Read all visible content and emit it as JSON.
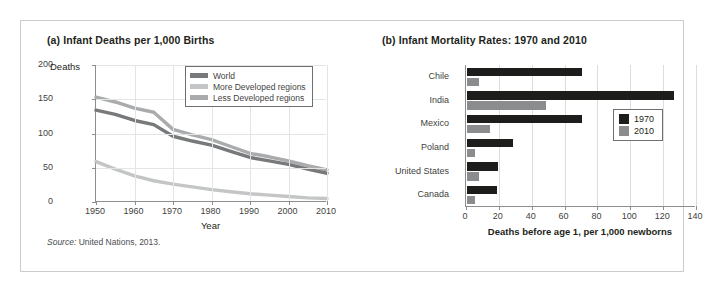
{
  "figure": {
    "source_prefix": "Source:",
    "source_text": " United Nations, 2013."
  },
  "panel_a": {
    "title": "(a) Infant Deaths per 1,000 Births",
    "ylabel": "Deaths",
    "xlabel": "Year",
    "legend": [
      {
        "label": "World",
        "color": "#77797b"
      },
      {
        "label": "More Developed regions",
        "color": "#c3c5c7"
      },
      {
        "label": "Less Developed regions",
        "color": "#a9abad"
      }
    ]
  },
  "panel_b": {
    "title": "(b) Infant Mortality Rates: 1970 and 2010",
    "xlabel": "Deaths before age 1, per 1,000 newborns",
    "legend": [
      {
        "label": "1970",
        "color": "#1d1d1b"
      },
      {
        "label": "2010",
        "color": "#8a8c8e"
      }
    ]
  },
  "chart_data": [
    {
      "type": "line",
      "title": "(a) Infant Deaths per 1,000 Births",
      "xlabel": "Year",
      "ylabel": "Deaths",
      "xlim": [
        1950,
        2010
      ],
      "ylim": [
        0,
        200
      ],
      "xticks": [
        1950,
        1960,
        1970,
        1980,
        1990,
        2000,
        2010
      ],
      "yticks": [
        0,
        50,
        100,
        150,
        200
      ],
      "grid": true,
      "legend_position": "top-right",
      "x": [
        1950,
        1955,
        1960,
        1965,
        1970,
        1975,
        1980,
        1985,
        1990,
        1995,
        2000,
        2005,
        2010
      ],
      "series": [
        {
          "name": "World",
          "color": "#77797b",
          "values": [
            134,
            128,
            119,
            113,
            96,
            89,
            83,
            74,
            65,
            60,
            55,
            48,
            42
          ]
        },
        {
          "name": "More Developed regions",
          "color": "#c3c5c7",
          "values": [
            59,
            48,
            38,
            31,
            26,
            22,
            18,
            15,
            12,
            10,
            8,
            6,
            5
          ]
        },
        {
          "name": "Less Developed regions",
          "color": "#a9abad",
          "values": [
            153,
            146,
            137,
            131,
            106,
            98,
            91,
            81,
            71,
            66,
            60,
            53,
            47
          ]
        }
      ]
    },
    {
      "type": "bar",
      "orientation": "horizontal",
      "title": "(b) Infant Mortality Rates: 1970 and 2010",
      "xlabel": "Deaths before age 1, per 1,000 newborns",
      "ylabel": "",
      "xlim": [
        0,
        140
      ],
      "xticks": [
        0,
        20,
        40,
        60,
        80,
        100,
        120,
        140
      ],
      "grid": true,
      "legend_position": "right",
      "categories": [
        "Chile",
        "India",
        "Mexico",
        "Poland",
        "United States",
        "Canada"
      ],
      "series": [
        {
          "name": "1970",
          "color": "#1d1d1b",
          "values": [
            70,
            126,
            70,
            28,
            19,
            18
          ]
        },
        {
          "name": "2010",
          "color": "#8a8c8e",
          "values": [
            7,
            48,
            14,
            5,
            7,
            5
          ]
        }
      ]
    }
  ]
}
